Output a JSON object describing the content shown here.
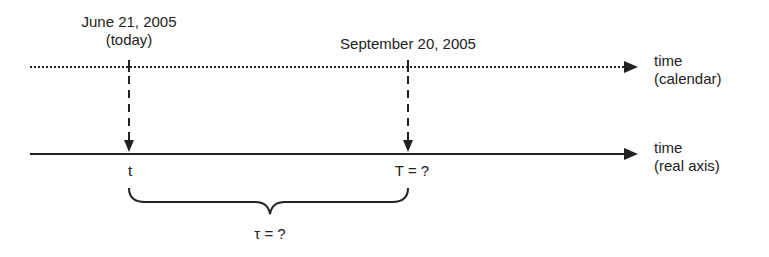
{
  "diagram": {
    "calendar_axis": {
      "label_line1": "time",
      "label_line2": "(calendar)",
      "style": "dotted"
    },
    "real_axis": {
      "label_line1": "time",
      "label_line2": "(real axis)",
      "style": "solid"
    },
    "events": [
      {
        "date_line1": "June 21, 2005",
        "date_line2": "(today)",
        "real_label": "t"
      },
      {
        "date_line1": "September 20, 2005",
        "date_line2": "",
        "real_label": "T = ?"
      }
    ],
    "interval_label": "τ = ?",
    "colors": {
      "ink": "#222222",
      "background": "#ffffff"
    }
  }
}
